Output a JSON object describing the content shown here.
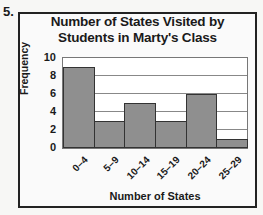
{
  "question_number": "5.",
  "chart_data": {
    "type": "bar",
    "title": "Number of States Visited by Students in Marty's Class",
    "title_lines": [
      "Number of States Visited by",
      "Students in Marty's Class"
    ],
    "xlabel": "Number of States",
    "ylabel": "Frequency",
    "categories": [
      "0–4",
      "5–9",
      "10–14",
      "15–19",
      "20–24",
      "25–29"
    ],
    "values": [
      9,
      3,
      5,
      3,
      6,
      1
    ],
    "ylim": [
      0,
      10
    ],
    "yticks": [
      0,
      2,
      4,
      6,
      8,
      10
    ],
    "grid": true,
    "legend": "none",
    "histogram": true,
    "bar_color": "#8f8f8f"
  }
}
